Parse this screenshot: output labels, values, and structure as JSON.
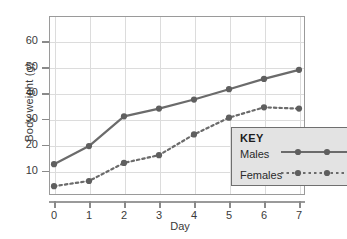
{
  "chart_data": {
    "type": "line",
    "title": "",
    "xlabel": "Day",
    "ylabel": "Body weight (g)",
    "x": [
      0,
      1,
      2,
      3,
      4,
      5,
      6,
      7
    ],
    "xtick_labels": [
      "0",
      "1",
      "2",
      "3",
      "4",
      "5",
      "6",
      "7"
    ],
    "ytick_labels": [
      "10",
      "20",
      "30",
      "40",
      "50",
      "60"
    ],
    "yticks": [
      10,
      20,
      30,
      40,
      50,
      60
    ],
    "xlim": [
      0,
      7
    ],
    "ylim": [
      0,
      65
    ],
    "grid": true,
    "legend_position": "bottom-right",
    "legend_title": "KEY",
    "series": [
      {
        "name": "Males",
        "linestyle": "solid",
        "color": "#6b6b6b",
        "marker": "circle",
        "values": [
          12.5,
          19.5,
          31.0,
          34.0,
          37.5,
          41.5,
          45.5,
          49.0
        ]
      },
      {
        "name": "Females",
        "linestyle": "dotted",
        "color": "#6b6b6b",
        "marker": "circle",
        "values": [
          4.0,
          6.0,
          13.0,
          16.0,
          24.0,
          30.5,
          34.5,
          34.0
        ]
      }
    ]
  },
  "colors": {
    "line": "#6b6b6b",
    "marker": "#5f5f5f",
    "grid": "#dcdcdc",
    "frame": "#9a9a9a",
    "text": "#3a3a3a",
    "legend_bg": "#e3e3e3",
    "legend_border": "#6f6f6f"
  }
}
